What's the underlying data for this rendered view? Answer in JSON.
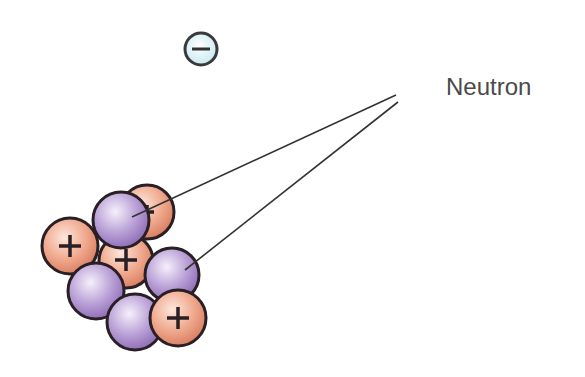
{
  "labels": {
    "neutron": "Neutron"
  },
  "symbols": {
    "proton": "+",
    "electron": "−"
  },
  "colors": {
    "proton": "#e8967a",
    "neutron": "#a68bc7",
    "electron": "#d8f0f6",
    "outline": "#2a1f24",
    "line": "#333333",
    "text": "#4a4a4a"
  },
  "particles": [
    {
      "type": "proton",
      "cx": 147,
      "cy": 212
    },
    {
      "type": "neutron",
      "cx": 121,
      "cy": 220
    },
    {
      "type": "proton",
      "cx": 70,
      "cy": 246
    },
    {
      "type": "proton",
      "cx": 126,
      "cy": 261
    },
    {
      "type": "neutron",
      "cx": 172,
      "cy": 275
    },
    {
      "type": "neutron",
      "cx": 96,
      "cy": 291
    },
    {
      "type": "neutron",
      "cx": 135,
      "cy": 322
    },
    {
      "type": "proton",
      "cx": 178,
      "cy": 318
    }
  ]
}
